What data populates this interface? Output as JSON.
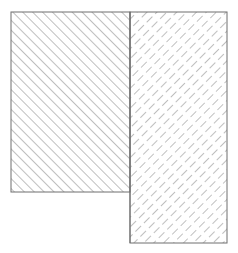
{
  "diagram": {
    "type": "hatched-regions",
    "background": "#ffffff",
    "stroke_color": "#6e6e6e",
    "hatch_color": "#8a8a8a",
    "regions": [
      {
        "id": "left-region",
        "hatch": "solid-forward-diagonal",
        "x": 11,
        "y": 12,
        "width": 119,
        "height": 180
      },
      {
        "id": "right-region",
        "hatch": "dashed-back-diagonal",
        "x": 130,
        "y": 12,
        "width": 97,
        "height": 231
      }
    ]
  }
}
